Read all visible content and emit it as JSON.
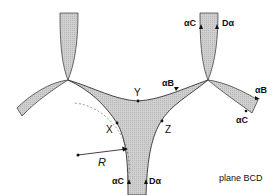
{
  "diagram": {
    "caption": "plane BCD",
    "points": {
      "Y": "Y",
      "X": "X",
      "Z": "Z"
    },
    "radius_label": "R",
    "edge_labels": {
      "top_right_left": "αC",
      "top_right_right": "Dα",
      "middle_upper": "αB",
      "right_upper": "αB",
      "right_lower": "αC",
      "bottom_left": "αC",
      "bottom_right": "Dα"
    },
    "colors": {
      "fill": "#c8c8c8",
      "stroke": "#333333"
    }
  }
}
